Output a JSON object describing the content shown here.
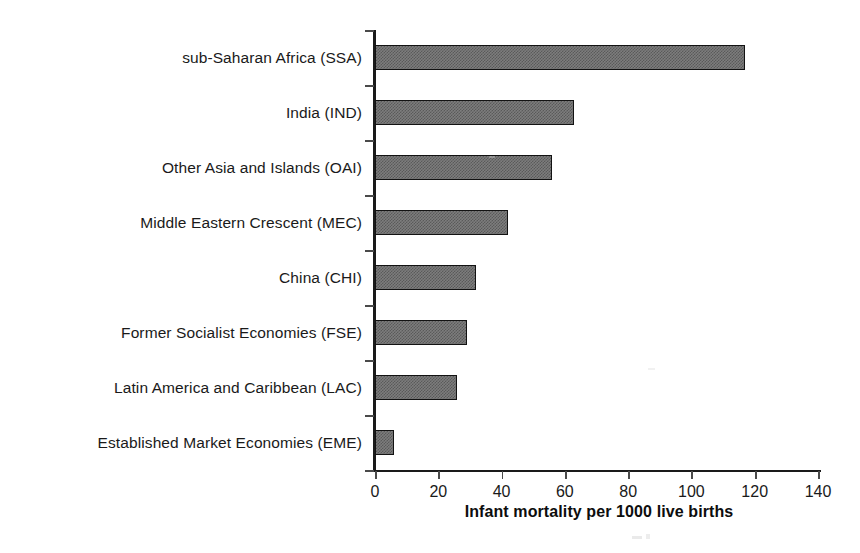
{
  "chart_data": {
    "type": "bar",
    "orientation": "horizontal",
    "title": "",
    "xlabel": "Infant mortality per 1000 live births",
    "ylabel": "",
    "categories": [
      "sub-Saharan Africa (SSA)",
      "India (IND)",
      "Other Asia and Islands (OAI)",
      "Middle Eastern Crescent (MEC)",
      "China (CHI)",
      "Former Socialist Economies (FSE)",
      "Latin America and Caribbean (LAC)",
      "Established Market Economies (EME)"
    ],
    "values": [
      117,
      63,
      56,
      42,
      32,
      29,
      26,
      6
    ],
    "xlim": [
      0,
      140
    ],
    "xticks": [
      0,
      20,
      40,
      60,
      80,
      100,
      120,
      140
    ],
    "xtick_labels": [
      "0",
      "20",
      "40",
      "60",
      "80",
      "100",
      "120",
      "140"
    ],
    "grid": false,
    "legend": false,
    "bar_fill_color": "#7d7d7d",
    "bar_edge_color": "#121212",
    "axis_color": "#1a1a1a",
    "background_color": "#ffffff"
  }
}
